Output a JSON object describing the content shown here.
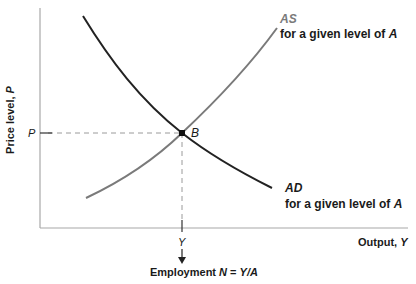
{
  "diagram": {
    "y_axis_label": "Price level, ",
    "y_axis_var": "P",
    "x_axis_label": "Output, ",
    "x_axis_var": "Y",
    "p_tick_label": "P",
    "y_tick_label": "Y",
    "equilibrium_label": "B",
    "as_curve": {
      "name": "AS",
      "caption": "for a given level of ",
      "caption_var": "A"
    },
    "ad_curve": {
      "name": "AD",
      "caption": "for a given level of ",
      "caption_var": "A"
    },
    "employment": {
      "text": "Employment ",
      "formula_var": "N",
      "equals": " = ",
      "formula_rhs": "Y/A"
    },
    "colors": {
      "ad": "#222222",
      "as": "#7a7a7a",
      "axis": "#a8a8a8",
      "dashed": "#9a9a9a"
    }
  }
}
